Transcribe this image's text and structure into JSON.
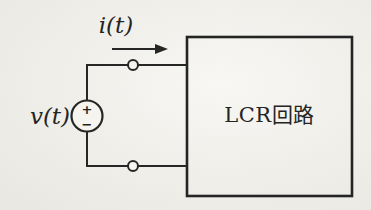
{
  "figure": {
    "type": "circuit-diagram",
    "description_visible_elements": "independent voltage source driving a two-terminal black box",
    "labels": {
      "current": "i(t)",
      "voltage": "v(t)",
      "box": "LCR回路",
      "source_plus": "+",
      "source_minus": "−"
    },
    "colors": {
      "line": "#262626",
      "paper": "#f2f1ec"
    }
  }
}
